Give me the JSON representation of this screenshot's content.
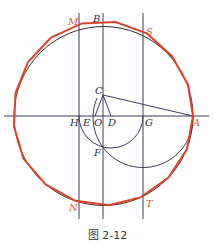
{
  "figure": {
    "caption": "图 2-12",
    "colors": {
      "lines": "#3a3a5e",
      "polygon": "#d9452a"
    },
    "labels": {
      "M": "M",
      "B": "B",
      "S": "S",
      "C": "C",
      "H": "H",
      "E": "E",
      "O": "O",
      "D": "D",
      "G": "G",
      "A": "A",
      "F": "F",
      "N": "N",
      "T": "T"
    }
  }
}
